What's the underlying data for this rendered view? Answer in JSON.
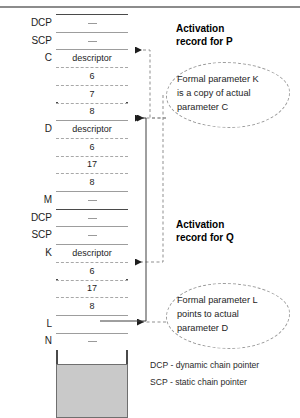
{
  "diagram": {
    "stack": {
      "cells": [
        {
          "label": "DCP",
          "value": "—",
          "top_border": "solid"
        },
        {
          "label": "SCP",
          "value": "—",
          "top_border": "thin"
        },
        {
          "label": "C",
          "value": "descriptor",
          "top_border": "thin"
        },
        {
          "label": "",
          "value": "6",
          "top_border": "dash"
        },
        {
          "label": "",
          "value": "7",
          "top_border": "dash"
        },
        {
          "label": "",
          "value": "8",
          "top_border": "dash"
        },
        {
          "label": "D",
          "value": "descriptor",
          "top_border": "thin"
        },
        {
          "label": "",
          "value": "6",
          "top_border": "dash"
        },
        {
          "label": "",
          "value": "17",
          "top_border": "dash"
        },
        {
          "label": "",
          "value": "8",
          "top_border": "dash"
        },
        {
          "label": "M",
          "value": "—",
          "top_border": "thin"
        },
        {
          "label": "DCP",
          "value": "—",
          "top_border": "solid"
        },
        {
          "label": "SCP",
          "value": "—",
          "top_border": "thin"
        },
        {
          "label": "K",
          "value": "descriptor",
          "top_border": "thin"
        },
        {
          "label": "",
          "value": "6",
          "top_border": "dash"
        },
        {
          "label": "",
          "value": "17",
          "top_border": "dash"
        },
        {
          "label": "",
          "value": "8",
          "top_border": "dash"
        },
        {
          "label": "L",
          "value": "",
          "top_border": "thin"
        },
        {
          "label": "N",
          "value": "—",
          "top_border": "thin"
        }
      ]
    },
    "annotations": {
      "activation_p": "Activation\nrecord for P",
      "activation_p_line1": "Activation",
      "activation_p_line2": "record for P",
      "activation_q_line1": "Activation",
      "activation_q_line2": "record for Q",
      "bubble_k": "Formal parameter K is a copy of actual parameter C",
      "bubble_k_line1": "Formal parameter K",
      "bubble_k_line2": "is a copy of actual",
      "bubble_k_line3": "parameter C",
      "bubble_l": "Formal parameter L points to actual parameter D",
      "bubble_l_line1": "Formal parameter L",
      "bubble_l_line2": "points to actual",
      "bubble_l_line3": "parameter D"
    },
    "legend": {
      "dcp": "DCP - dynamic chain pointer",
      "scp": "SCP - static chain pointer"
    },
    "colors": {
      "border": "#4a4a4a",
      "dashed": "#9b9b9b",
      "gray_block": "#c9c9c9",
      "text": "#1d1d1d"
    }
  }
}
